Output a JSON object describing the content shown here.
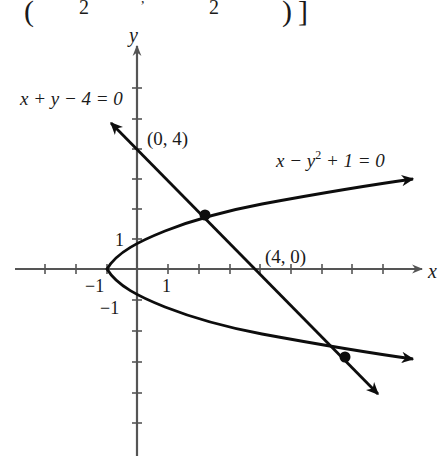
{
  "header_fragment": {
    "open_paren": "(",
    "num_left": "2",
    "comma": ",",
    "num_right": "2",
    "close_paren": ")",
    "close_bracket": "]"
  },
  "axes": {
    "x_label": "x",
    "y_label": "y",
    "tick_label_x_pos1": "1",
    "tick_label_x_neg1": "−1",
    "tick_label_y_pos1": "1",
    "tick_label_y_neg1": "−1",
    "x_range": [
      -4,
      9
    ],
    "y_range": [
      -6,
      7
    ],
    "colors": {
      "axis": "#555555",
      "curve": "#0d0d0d"
    }
  },
  "curves": {
    "line": {
      "equation": "x + y − 4 = 0"
    },
    "parabola": {
      "equation_pre": "x − y",
      "equation_sup": "2",
      "equation_post": " + 1 = 0"
    }
  },
  "points": {
    "y_intercept_label": "(0, 4)",
    "x_intercept_label": "(4, 0)"
  },
  "intersections": [
    {
      "x": 2.21,
      "y": 1.79
    },
    {
      "x": 6.79,
      "y": -2.79
    }
  ]
}
